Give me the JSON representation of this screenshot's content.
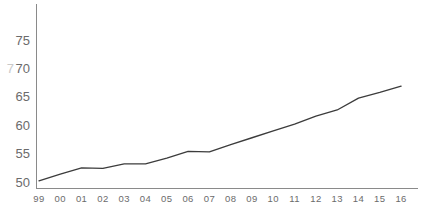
{
  "chart_data": {
    "type": "line",
    "title": "",
    "subtitle": "",
    "xlabel": "",
    "ylabel": "",
    "categories": [
      "99",
      "00",
      "01",
      "02",
      "03",
      "04",
      "05",
      "06",
      "07",
      "08",
      "09",
      "10",
      "11",
      "12",
      "13",
      "14",
      "15",
      "16"
    ],
    "x": [
      1999,
      2000,
      2001,
      2002,
      2003,
      2004,
      2005,
      2006,
      2007,
      2008,
      2009,
      2010,
      2011,
      2012,
      2013,
      2014,
      2015,
      2016
    ],
    "series": [
      {
        "name": "",
        "values": [
          50.2,
          51.4,
          52.5,
          52.4,
          53.2,
          53.2,
          54.2,
          55.4,
          55.3,
          56.6,
          57.8,
          59.0,
          60.2,
          61.6,
          62.7,
          64.8,
          65.8,
          66.9
        ]
      }
    ],
    "values": [
      50.2,
      51.4,
      52.5,
      52.4,
      53.2,
      53.2,
      54.2,
      55.4,
      55.3,
      56.6,
      57.8,
      59.0,
      60.2,
      61.6,
      62.7,
      64.8,
      65.8,
      66.9
    ],
    "ylim": [
      48.2,
      78.0
    ],
    "yticks": [
      50,
      55,
      60,
      65,
      70,
      75
    ],
    "ytick_labels": [
      "50",
      "55",
      "60",
      "65",
      "70",
      "75"
    ],
    "xtick_labels": [
      "99",
      "00",
      "01",
      "02",
      "03",
      "04",
      "05",
      "06",
      "07",
      "08",
      "09",
      "10",
      "11",
      "12",
      "13",
      "14",
      "15",
      "16"
    ],
    "grid": false,
    "legend": false,
    "legend_position": "none",
    "axes": {
      "left_spine": true,
      "bottom_spine": true,
      "top_spine": false,
      "right_spine": false
    },
    "colors": {
      "line": "#3c3c3c",
      "axis": "#8a8a8a",
      "tick_label": "#6b6b6b",
      "background": "#ffffff"
    },
    "edge_artifact": "7"
  }
}
